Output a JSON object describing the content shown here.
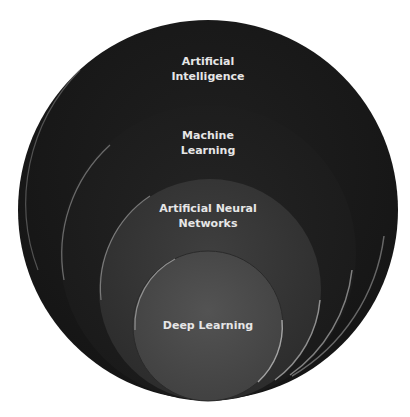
{
  "diagram": {
    "type": "nested-circles",
    "circles": [
      {
        "label_line1": "Artificial",
        "label_line2": "Intelligence",
        "fill": "#1e1e1e"
      },
      {
        "label_line1": "Machine",
        "label_line2": "Learning",
        "fill": "#222222"
      },
      {
        "label_line1": "Artificial Neural",
        "label_line2": "Networks",
        "fill": "#383838"
      },
      {
        "label_line1": "Deep Learning",
        "label_line2": "",
        "fill": "#4a4a4a"
      }
    ],
    "highlight_color": "#9a9a9a",
    "text_color": "#e6e6e6"
  }
}
